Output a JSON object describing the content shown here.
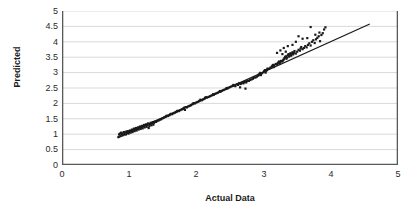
{
  "chart_data": {
    "type": "scatter",
    "title": "",
    "xlabel": "Actual Data",
    "ylabel": "Predicted",
    "xlim": [
      0,
      5
    ],
    "ylim": [
      0,
      5
    ],
    "xticks": [
      "0",
      "1",
      "2",
      "3",
      "4",
      "5"
    ],
    "yticks": [
      "0",
      "0.5",
      "1",
      "1.5",
      "2",
      "2.5",
      "3",
      "3.5",
      "4",
      "4.5",
      "5"
    ],
    "grid": "horizontal",
    "legend": "none",
    "marker_color": "#1a1a1a",
    "marker_shape": "square",
    "marker_size": 2.2,
    "line_color": "#1a1a1a",
    "axis_color": "#595959",
    "grid_color": "#d9d9d9",
    "reference_line": {
      "name": "trend-line",
      "x": [
        0.83,
        4.58
      ],
      "y": [
        0.88,
        4.58
      ]
    },
    "series": [
      {
        "name": "Predicted vs Actual",
        "points": [
          [
            0.84,
            0.91
          ],
          [
            0.85,
            0.99
          ],
          [
            0.86,
            1.02
          ],
          [
            0.87,
            0.95
          ],
          [
            0.88,
            1.05
          ],
          [
            0.89,
            1.0
          ],
          [
            0.9,
            1.03
          ],
          [
            0.91,
            0.97
          ],
          [
            0.92,
            1.07
          ],
          [
            0.93,
            1.01
          ],
          [
            0.94,
            1.06
          ],
          [
            0.95,
            0.99
          ],
          [
            0.96,
            1.09
          ],
          [
            0.97,
            1.04
          ],
          [
            0.98,
            1.1
          ],
          [
            0.99,
            1.02
          ],
          [
            1.0,
            1.08
          ],
          [
            1.01,
            1.12
          ],
          [
            1.02,
            1.05
          ],
          [
            1.03,
            1.1
          ],
          [
            1.04,
            1.15
          ],
          [
            1.05,
            1.07
          ],
          [
            1.06,
            1.13
          ],
          [
            1.07,
            1.18
          ],
          [
            1.08,
            1.1
          ],
          [
            1.09,
            1.16
          ],
          [
            1.1,
            1.2
          ],
          [
            1.11,
            1.12
          ],
          [
            1.12,
            1.18
          ],
          [
            1.13,
            1.22
          ],
          [
            1.14,
            1.15
          ],
          [
            1.15,
            1.21
          ],
          [
            1.16,
            1.25
          ],
          [
            1.17,
            1.17
          ],
          [
            1.18,
            1.23
          ],
          [
            1.19,
            1.27
          ],
          [
            1.2,
            1.19
          ],
          [
            1.21,
            1.25
          ],
          [
            1.22,
            1.3
          ],
          [
            1.23,
            1.22
          ],
          [
            1.24,
            1.28
          ],
          [
            1.25,
            1.32
          ],
          [
            1.26,
            1.24
          ],
          [
            1.27,
            1.3
          ],
          [
            1.28,
            1.35
          ],
          [
            1.29,
            1.2
          ],
          [
            1.3,
            1.27
          ],
          [
            1.31,
            1.33
          ],
          [
            1.32,
            1.37
          ],
          [
            1.33,
            1.29
          ],
          [
            1.34,
            1.35
          ],
          [
            1.35,
            1.39
          ],
          [
            1.36,
            1.31
          ],
          [
            1.37,
            1.37
          ],
          [
            1.38,
            1.41
          ],
          [
            1.4,
            1.4
          ],
          [
            1.42,
            1.43
          ],
          [
            1.44,
            1.45
          ],
          [
            1.46,
            1.47
          ],
          [
            1.48,
            1.49
          ],
          [
            1.5,
            1.52
          ],
          [
            1.52,
            1.54
          ],
          [
            1.54,
            1.56
          ],
          [
            1.55,
            1.58
          ],
          [
            1.56,
            1.6
          ],
          [
            1.58,
            1.59
          ],
          [
            1.6,
            1.62
          ],
          [
            1.61,
            1.64
          ],
          [
            1.62,
            1.66
          ],
          [
            1.64,
            1.65
          ],
          [
            1.66,
            1.68
          ],
          [
            1.68,
            1.7
          ],
          [
            1.7,
            1.72
          ],
          [
            1.71,
            1.74
          ],
          [
            1.72,
            1.76
          ],
          [
            1.74,
            1.75
          ],
          [
            1.76,
            1.78
          ],
          [
            1.78,
            1.8
          ],
          [
            1.8,
            1.82
          ],
          [
            1.81,
            1.84
          ],
          [
            1.82,
            1.86
          ],
          [
            1.83,
            1.79
          ],
          [
            1.84,
            1.88
          ],
          [
            1.86,
            1.87
          ],
          [
            1.88,
            1.9
          ],
          [
            1.9,
            1.92
          ],
          [
            1.92,
            1.94
          ],
          [
            1.94,
            1.97
          ],
          [
            1.95,
            1.99
          ],
          [
            1.96,
            2.01
          ],
          [
            1.98,
            2.0
          ],
          [
            2.0,
            2.03
          ],
          [
            2.02,
            2.05
          ],
          [
            2.04,
            2.07
          ],
          [
            2.05,
            2.09
          ],
          [
            2.06,
            2.12
          ],
          [
            2.08,
            2.1
          ],
          [
            2.1,
            2.13
          ],
          [
            2.12,
            2.15
          ],
          [
            2.13,
            2.18
          ],
          [
            2.14,
            2.2
          ],
          [
            2.16,
            2.19
          ],
          [
            2.18,
            2.21
          ],
          [
            2.2,
            2.23
          ],
          [
            2.22,
            2.25
          ],
          [
            2.24,
            2.27
          ],
          [
            2.25,
            2.3
          ],
          [
            2.26,
            2.28
          ],
          [
            2.28,
            2.31
          ],
          [
            2.3,
            2.33
          ],
          [
            2.32,
            2.35
          ],
          [
            2.34,
            2.37
          ],
          [
            2.35,
            2.4
          ],
          [
            2.36,
            2.38
          ],
          [
            2.38,
            2.41
          ],
          [
            2.4,
            2.43
          ],
          [
            2.42,
            2.45
          ],
          [
            2.44,
            2.47
          ],
          [
            2.45,
            2.5
          ],
          [
            2.46,
            2.48
          ],
          [
            2.48,
            2.51
          ],
          [
            2.5,
            2.53
          ],
          [
            2.52,
            2.55
          ],
          [
            2.54,
            2.57
          ],
          [
            2.55,
            2.6
          ],
          [
            2.56,
            2.58
          ],
          [
            2.58,
            2.56
          ],
          [
            2.6,
            2.62
          ],
          [
            2.62,
            2.6
          ],
          [
            2.63,
            2.64
          ],
          [
            2.64,
            2.66
          ],
          [
            2.65,
            2.52
          ],
          [
            2.66,
            2.63
          ],
          [
            2.68,
            2.67
          ],
          [
            2.7,
            2.65
          ],
          [
            2.71,
            2.69
          ],
          [
            2.72,
            2.71
          ],
          [
            2.73,
            2.48
          ],
          [
            2.74,
            2.68
          ],
          [
            2.75,
            2.72
          ],
          [
            2.76,
            2.74
          ],
          [
            2.78,
            2.73
          ],
          [
            2.8,
            2.76
          ],
          [
            2.82,
            2.78
          ],
          [
            2.84,
            2.8
          ],
          [
            2.85,
            2.83
          ],
          [
            2.86,
            2.85
          ],
          [
            2.88,
            2.84
          ],
          [
            2.9,
            2.87
          ],
          [
            2.92,
            2.9
          ],
          [
            2.93,
            2.93
          ],
          [
            2.94,
            2.96
          ],
          [
            2.95,
            2.99
          ],
          [
            2.96,
            2.92
          ],
          [
            2.98,
            2.98
          ],
          [
            3.0,
            3.02
          ],
          [
            3.01,
            3.05
          ],
          [
            3.02,
            3.08
          ],
          [
            3.03,
            3.0
          ],
          [
            3.04,
            3.06
          ],
          [
            3.05,
            3.1
          ],
          [
            3.06,
            3.13
          ],
          [
            3.08,
            3.12
          ],
          [
            3.1,
            3.16
          ],
          [
            3.12,
            3.19
          ],
          [
            3.13,
            3.22
          ],
          [
            3.14,
            3.25
          ],
          [
            3.15,
            3.18
          ],
          [
            3.16,
            3.24
          ],
          [
            3.18,
            3.28
          ],
          [
            3.2,
            3.26
          ],
          [
            3.21,
            3.3
          ],
          [
            3.22,
            3.33
          ],
          [
            3.23,
            3.36
          ],
          [
            3.24,
            3.29
          ],
          [
            3.25,
            3.34
          ],
          [
            3.26,
            3.38
          ],
          [
            3.28,
            3.36
          ],
          [
            3.29,
            3.4
          ],
          [
            3.3,
            3.43
          ],
          [
            3.31,
            3.47
          ],
          [
            3.32,
            3.5
          ],
          [
            3.33,
            3.53
          ],
          [
            3.34,
            3.45
          ],
          [
            3.35,
            3.49
          ],
          [
            3.36,
            3.56
          ],
          [
            3.37,
            3.6
          ],
          [
            3.38,
            3.52
          ],
          [
            3.39,
            3.58
          ],
          [
            3.4,
            3.63
          ],
          [
            3.41,
            3.55
          ],
          [
            3.42,
            3.61
          ],
          [
            3.43,
            3.66
          ],
          [
            3.44,
            3.59
          ],
          [
            3.45,
            3.64
          ],
          [
            3.46,
            3.7
          ],
          [
            3.48,
            3.62
          ],
          [
            3.5,
            3.68
          ],
          [
            3.52,
            3.74
          ],
          [
            3.54,
            3.71
          ],
          [
            3.55,
            3.78
          ],
          [
            3.56,
            3.83
          ],
          [
            3.58,
            3.76
          ],
          [
            3.6,
            3.8
          ],
          [
            3.62,
            3.86
          ],
          [
            3.64,
            3.82
          ],
          [
            3.66,
            3.9
          ],
          [
            3.68,
            3.95
          ],
          [
            3.7,
            3.88
          ],
          [
            3.72,
            4.0
          ],
          [
            3.74,
            4.05
          ],
          [
            3.76,
            3.96
          ],
          [
            3.78,
            4.08
          ],
          [
            3.8,
            4.13
          ],
          [
            3.82,
            4.18
          ],
          [
            3.84,
            4.02
          ],
          [
            3.86,
            4.22
          ],
          [
            3.88,
            4.28
          ],
          [
            3.9,
            4.4
          ],
          [
            3.92,
            4.47
          ],
          [
            3.65,
            4.12
          ],
          [
            3.58,
            4.1
          ],
          [
            3.48,
            4.0
          ],
          [
            3.52,
            4.18
          ],
          [
            3.43,
            3.9
          ],
          [
            3.36,
            3.86
          ],
          [
            3.3,
            3.8
          ],
          [
            3.25,
            3.72
          ],
          [
            3.2,
            3.64
          ],
          [
            3.7,
            4.48
          ],
          [
            3.83,
            4.3
          ],
          [
            3.77,
            4.23
          ],
          [
            3.33,
            3.68
          ],
          [
            3.28,
            3.6
          ]
        ]
      }
    ]
  },
  "axis": {
    "y_label": "Predicted",
    "x_label": "Actual Data"
  }
}
